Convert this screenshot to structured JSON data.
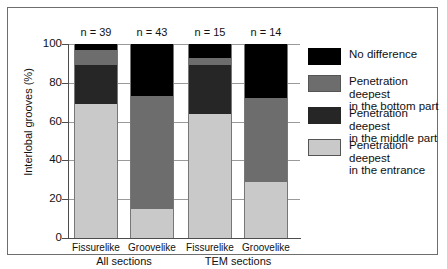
{
  "chart_data": {
    "type": "bar",
    "subtype": "stacked-vertical-100",
    "title": "",
    "xlabel": "",
    "ylabel": "Interlobal grooves (%)",
    "ylim": [
      0,
      100
    ],
    "yticks": [
      0,
      20,
      40,
      60,
      80,
      100
    ],
    "ytick_labels": [
      "0",
      "20",
      "40",
      "60",
      "80",
      "100"
    ],
    "grid": true,
    "grid_axis": "y",
    "legend_position": "right",
    "categories": [
      "Fissurelike",
      "Groovelike",
      "Fissurelike",
      "Groovelike"
    ],
    "groups": [
      {
        "label": "All sections",
        "categories": [
          "Fissurelike",
          "Groovelike"
        ]
      },
      {
        "label": "TEM sections",
        "categories": [
          "Fissurelike",
          "Groovelike"
        ]
      }
    ],
    "annotations": [
      "n = 39",
      "n = 43",
      "n = 15",
      "n = 14"
    ],
    "series": [
      {
        "name": "Penetration deepest in the entrance",
        "key": "entrance",
        "color": "#c9c9c9",
        "values": [
          69,
          15,
          64,
          29
        ]
      },
      {
        "name": "Penetration deepest in the middle part",
        "key": "middle_part",
        "color": "#262626",
        "values": [
          20,
          0,
          25,
          0
        ]
      },
      {
        "name": "Penetration deepest in the bottom part",
        "key": "bottom_part",
        "color": "#6d6d6d",
        "values": [
          8,
          58,
          4,
          43
        ]
      },
      {
        "name": "No difference",
        "key": "no_difference",
        "color": "#000000",
        "values": [
          3,
          27,
          7,
          28
        ]
      }
    ],
    "bars": [
      {
        "category": "Fissurelike",
        "group": "All sections",
        "n_label": "n = 39",
        "n": 39,
        "segments": [
          {
            "key": "entrance",
            "value": 69
          },
          {
            "key": "middle_part",
            "value": 20
          },
          {
            "key": "bottom_part",
            "value": 8
          },
          {
            "key": "no_difference",
            "value": 3
          }
        ]
      },
      {
        "category": "Groovelike",
        "group": "All sections",
        "n_label": "n = 43",
        "n": 43,
        "segments": [
          {
            "key": "entrance",
            "value": 15
          },
          {
            "key": "middle_part",
            "value": 0
          },
          {
            "key": "bottom_part",
            "value": 58
          },
          {
            "key": "no_difference",
            "value": 27
          }
        ]
      },
      {
        "category": "Fissurelike",
        "group": "TEM sections",
        "n_label": "n = 15",
        "n": 15,
        "segments": [
          {
            "key": "entrance",
            "value": 64
          },
          {
            "key": "middle_part",
            "value": 25
          },
          {
            "key": "bottom_part",
            "value": 4
          },
          {
            "key": "no_difference",
            "value": 7
          }
        ]
      },
      {
        "category": "Groovelike",
        "group": "TEM sections",
        "n_label": "n = 14",
        "n": 14,
        "segments": [
          {
            "key": "entrance",
            "value": 29
          },
          {
            "key": "middle_part",
            "value": 0
          },
          {
            "key": "bottom_part",
            "value": 43
          },
          {
            "key": "no_difference",
            "value": 28
          }
        ]
      }
    ]
  },
  "legend": {
    "items": [
      {
        "label": "No difference",
        "key": "no_difference",
        "color": "#000000"
      },
      {
        "label": "Penetration deepest\nin the bottom part",
        "key": "bottom_part",
        "color": "#6d6d6d"
      },
      {
        "label": "Penetration deepest\nin the middle part",
        "key": "middle_part",
        "color": "#262626"
      },
      {
        "label": "Penetration deepest\nin the entrance",
        "key": "entrance",
        "color": "#c9c9c9"
      }
    ]
  },
  "axis": {
    "y_title": "Interlobal grooves (%)",
    "y_tick_labels": [
      "100",
      "80",
      "60",
      "40",
      "20",
      "0"
    ]
  }
}
